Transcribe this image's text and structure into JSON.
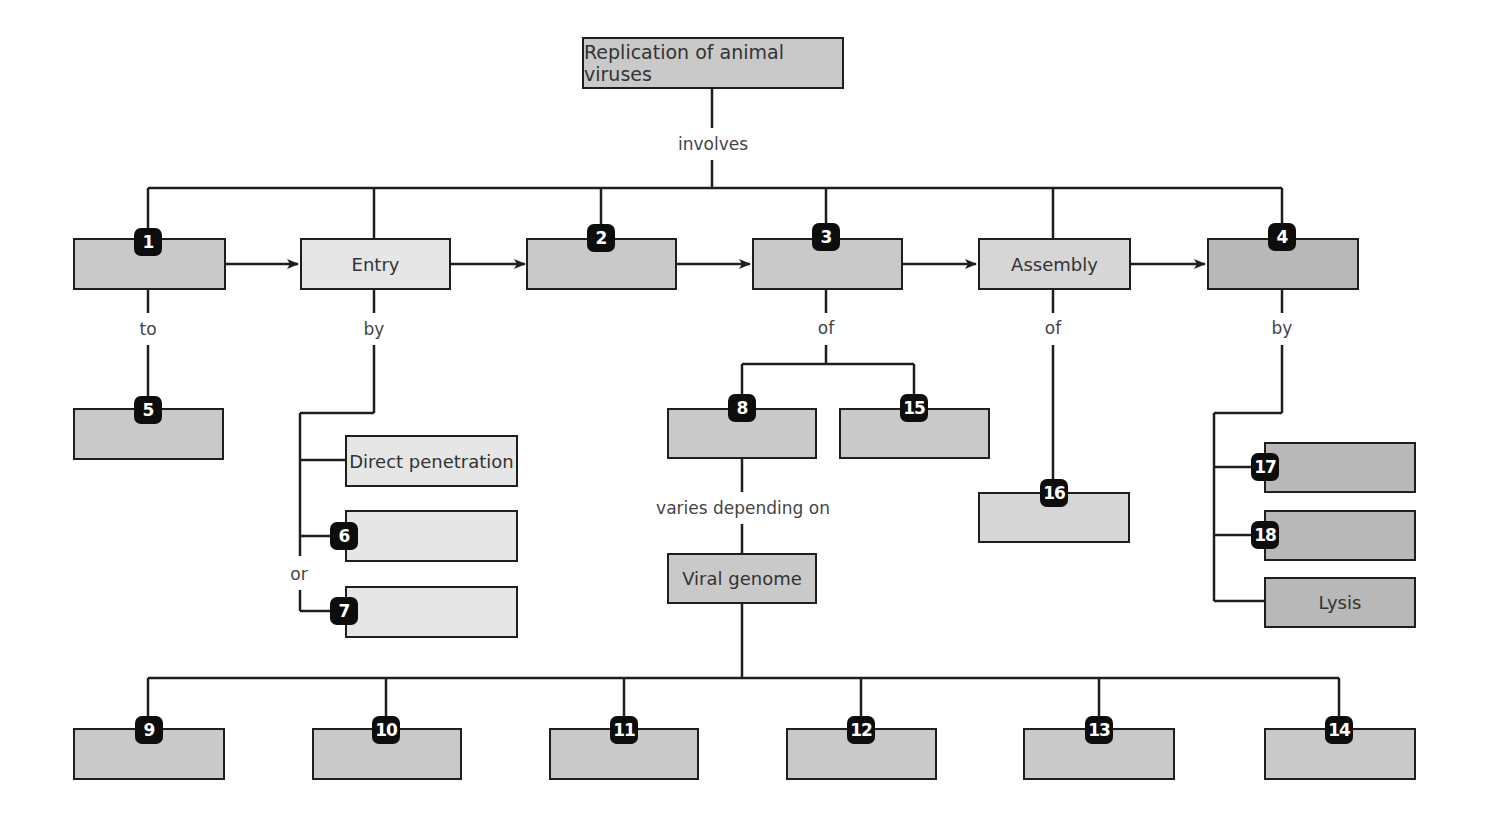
{
  "title": "Replication of animal viruses",
  "link_labels": {
    "involves": "involves",
    "to": "to",
    "by_entry": "by",
    "of_3": "of",
    "of_assembly": "of",
    "by_4": "by",
    "varies": "varies depending on",
    "or": "or"
  },
  "stages": {
    "s1": {
      "badge": "1",
      "label": ""
    },
    "entry": {
      "label": "Entry"
    },
    "s2": {
      "badge": "2",
      "label": ""
    },
    "s3": {
      "badge": "3",
      "label": ""
    },
    "assembly": {
      "label": "Assembly"
    },
    "s4": {
      "badge": "4",
      "label": ""
    }
  },
  "nodes": {
    "n5": {
      "badge": "5",
      "label": ""
    },
    "direct": {
      "label": "Direct penetration"
    },
    "n6": {
      "badge": "6",
      "label": ""
    },
    "n7": {
      "badge": "7",
      "label": ""
    },
    "n8": {
      "badge": "8",
      "label": ""
    },
    "n15": {
      "badge": "15",
      "label": ""
    },
    "genome": {
      "label": "Viral genome"
    },
    "n16": {
      "badge": "16",
      "label": ""
    },
    "n17": {
      "badge": "17",
      "label": ""
    },
    "n18": {
      "badge": "18",
      "label": ""
    },
    "lysis": {
      "label": "Lysis"
    },
    "n9": {
      "badge": "9",
      "label": ""
    },
    "n10": {
      "badge": "10",
      "label": ""
    },
    "n11": {
      "badge": "11",
      "label": ""
    },
    "n12": {
      "badge": "12",
      "label": ""
    },
    "n13": {
      "badge": "13",
      "label": ""
    },
    "n14": {
      "badge": "14",
      "label": ""
    }
  },
  "colors": {
    "line": "#1e1e1e",
    "box_mid": "#c9c9c9",
    "box_light": "#e6e6e6",
    "box_dark": "#b8b8b8",
    "badge": "#0d0d0d"
  }
}
